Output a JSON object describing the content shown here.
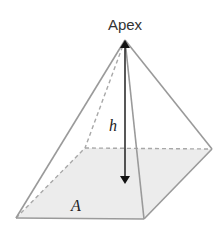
{
  "diagram": {
    "labels": {
      "apex": "Apex",
      "height": "h",
      "base_area": "A"
    },
    "colors": {
      "edge": "#9a9a9a",
      "base_fill": "#ececec",
      "arrow": "#111111",
      "text": "#333333"
    },
    "vertices": {
      "apex": [
        125,
        40
      ],
      "front_left": [
        16,
        218
      ],
      "front_right": [
        144,
        219
      ],
      "back_right": [
        212,
        149
      ],
      "back_left": [
        85,
        148
      ]
    }
  }
}
